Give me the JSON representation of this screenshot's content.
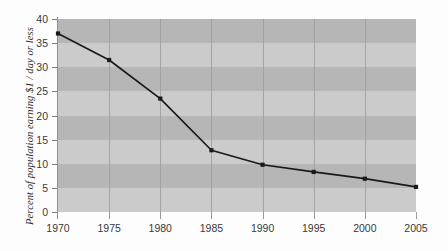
{
  "chart_data": {
    "type": "line",
    "title": "",
    "xlabel": "",
    "ylabel": "Percent of population earning $1 / day or less",
    "x": [
      1970,
      1975,
      1980,
      1985,
      1990,
      1995,
      2000,
      2005
    ],
    "xticklabels": [
      "1970",
      "1975",
      "1980",
      "1985",
      "1990",
      "1995",
      "2000",
      "2005"
    ],
    "yticklabels": [
      "0",
      "5",
      "10",
      "15",
      "20",
      "25",
      "30",
      "35",
      "40"
    ],
    "yticks": [
      0,
      5,
      10,
      15,
      20,
      25,
      30,
      35,
      40
    ],
    "values": [
      37.0,
      31.5,
      23.5,
      12.8,
      9.8,
      8.3,
      6.9,
      5.2
    ],
    "series": [
      {
        "name": "Percent of population earning $1 / day or less",
        "values": [
          37.0,
          31.5,
          23.5,
          12.8,
          9.8,
          8.3,
          6.9,
          5.2
        ]
      }
    ],
    "xlim": [
      1970,
      2005
    ],
    "ylim": [
      0,
      40
    ],
    "grid": "vertical gridlines at each x tick; alternating horizontal gray bands every 5 units",
    "legend": "none",
    "marker": "filled square",
    "line_color": "#1a1a1a",
    "band_dark_color": "#b6b6b6",
    "band_light_color": "#cbcbcb",
    "gridline_color": "#9a9a9a",
    "axis_color": "#8f8f8f",
    "background_color": "#fdfdfd",
    "tick_label_color": "#3a3a3a"
  }
}
